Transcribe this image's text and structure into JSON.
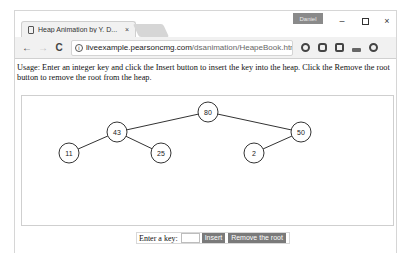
{
  "browser": {
    "tab": {
      "title": "Heap Animation by Y. D...",
      "close": "×"
    },
    "profile_badge": "Daniel",
    "window_controls": {
      "minimize": "–",
      "close": "×"
    },
    "nav": {
      "back": "←",
      "forward": "→",
      "reload": "C"
    },
    "omnibox": {
      "info": "i",
      "url_host": "liveexample.pearsoncmg.com",
      "url_path": "/dsanimation/HeapeBook.html",
      "zoom": "🔍",
      "star": "☆"
    },
    "extensions": [
      "opera-icon",
      "shield-icon",
      "square-icon",
      "car-icon",
      "circle-icon"
    ]
  },
  "page": {
    "usage_text": "Usage: Enter an integer key and click the Insert button to insert the key into the heap. Click the Remove the root button to remove the root from the heap.",
    "controls": {
      "key_label": "Enter a key:",
      "key_value": "",
      "insert_label": "Insert",
      "remove_label": "Remove the root"
    },
    "heap": {
      "nodes": [
        {
          "key": "80",
          "x": 186,
          "y": 16
        },
        {
          "key": "43",
          "x": 95,
          "y": 36
        },
        {
          "key": "50",
          "x": 279,
          "y": 36
        },
        {
          "key": "11",
          "x": 47,
          "y": 57
        },
        {
          "key": "25",
          "x": 139,
          "y": 57
        },
        {
          "key": "2",
          "x": 232,
          "y": 57
        }
      ],
      "edges": [
        [
          0,
          1
        ],
        [
          0,
          2
        ],
        [
          1,
          3
        ],
        [
          1,
          4
        ],
        [
          2,
          5
        ]
      ],
      "node_radius": 10,
      "stroke_color": "#333333"
    }
  }
}
